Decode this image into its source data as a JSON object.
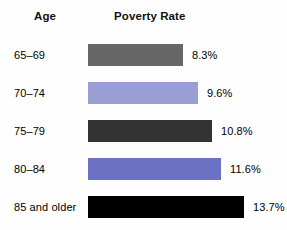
{
  "header": {
    "category_header": "Age",
    "value_header": "Poverty Rate"
  },
  "chart_data": {
    "type": "bar",
    "orientation": "horizontal",
    "title": "Poverty Rate",
    "xlabel": "",
    "ylabel": "Age",
    "grid": false,
    "legend": null,
    "xlim": [
      0,
      13.7
    ],
    "categories": [
      "65–69",
      "70–74",
      "75–79",
      "80–84",
      "85 and older"
    ],
    "values": [
      8.3,
      9.6,
      10.8,
      11.6,
      13.7
    ],
    "value_labels": [
      "8.3%",
      "9.6%",
      "10.8%",
      "11.6%",
      "13.7%"
    ],
    "bar_colors": [
      "#666666",
      "#9a9ed4",
      "#333333",
      "#6b72c4",
      "#000000"
    ],
    "bar_pixel_widths": [
      95,
      110,
      124,
      133,
      156
    ],
    "background_color": "#fefefe",
    "text_color": "#000000"
  },
  "rows": [
    {
      "category": "65–69",
      "value_label": "8.3%",
      "value": 8.3,
      "color": "#666666",
      "width": 95
    },
    {
      "category": "70–74",
      "value_label": "9.6%",
      "value": 9.6,
      "color": "#9a9ed4",
      "width": 110
    },
    {
      "category": "75–79",
      "value_label": "10.8%",
      "value": 10.8,
      "color": "#333333",
      "width": 124
    },
    {
      "category": "80–84",
      "value_label": "11.6%",
      "value": 11.6,
      "color": "#6b72c4",
      "width": 133
    },
    {
      "category": "85 and older",
      "value_label": "13.7%",
      "value": 13.7,
      "color": "#000000",
      "width": 156
    }
  ]
}
